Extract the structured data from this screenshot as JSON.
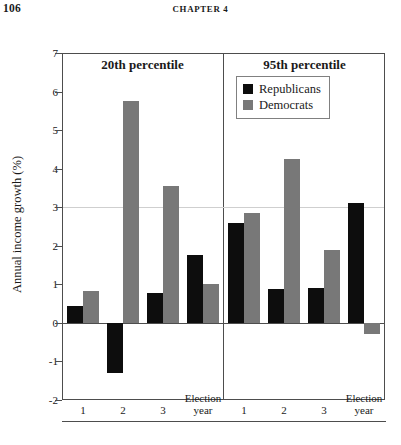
{
  "running_head": {
    "page_number": "106",
    "chapter": "CHAPTER 4"
  },
  "chart_data": {
    "type": "bar",
    "title": "",
    "xlabel": "",
    "ylabel": "Annual income growth (%)",
    "ylim": [
      -2,
      7
    ],
    "ytick_labels": [
      "7",
      "6",
      "5",
      "4",
      "3",
      "2",
      "1",
      "0",
      "-1",
      "-2"
    ],
    "ytick_values": [
      7,
      6,
      5,
      4,
      3,
      2,
      1,
      0,
      -1,
      -2
    ],
    "grid": true,
    "legend_position": "top-right",
    "legend": [
      {
        "name": "Republicans",
        "color": "#0d0d0d"
      },
      {
        "name": "Democrats",
        "color": "#787878"
      }
    ],
    "panels": [
      {
        "title": "20th percentile",
        "categories": [
          "1",
          "2",
          "3",
          "Election year"
        ],
        "series": [
          {
            "name": "Republicans",
            "color": "#0d0d0d",
            "values": [
              0.45,
              -1.3,
              0.78,
              1.75
            ]
          },
          {
            "name": "Democrats",
            "color": "#787878",
            "values": [
              0.82,
              5.75,
              3.55,
              1.0
            ]
          }
        ]
      },
      {
        "title": "95th percentile",
        "categories": [
          "1",
          "2",
          "3",
          "Election year"
        ],
        "series": [
          {
            "name": "Republicans",
            "color": "#0d0d0d",
            "values": [
              2.6,
              0.88,
              0.9,
              3.1
            ]
          },
          {
            "name": "Democrats",
            "color": "#787878",
            "values": [
              2.85,
              4.25,
              1.88,
              -0.28
            ]
          }
        ]
      }
    ],
    "election_year_label_line1": "Election",
    "election_year_label_line2": "year"
  }
}
